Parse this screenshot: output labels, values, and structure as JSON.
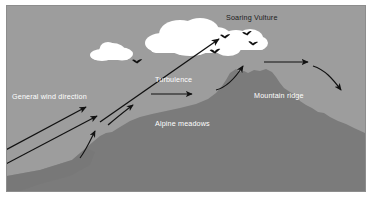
{
  "figure": {
    "frame": {
      "border_color": "#8d8d8d",
      "background_color": "#9d9d9d"
    },
    "colors": {
      "sky": "#9d9d9d",
      "mountain": "#7b7b7b",
      "mountain_shadow": "#6f6f6f",
      "cloud": "#ffffff",
      "arrow": "#111111",
      "label_light": "#ffffff",
      "label_dark": "#1b1b1b",
      "page": "#ffffff"
    },
    "labels": [
      {
        "id": "general-wind-direction",
        "text": "General wind direction",
        "x": 12,
        "y": 99,
        "tone": "light"
      },
      {
        "id": "turbulence",
        "text": "Turbulence",
        "x": 155,
        "y": 82,
        "tone": "light"
      },
      {
        "id": "soaring-vulture",
        "text": "Soaring Vulture",
        "x": 226,
        "y": 20,
        "tone": "dark"
      },
      {
        "id": "alpine-meadows",
        "text": "Alpine meadows",
        "x": 155,
        "y": 126,
        "tone": "light"
      },
      {
        "id": "mountain-ridge",
        "text": "Mountain ridge",
        "x": 254,
        "y": 98,
        "tone": "light"
      }
    ],
    "arrows": [
      {
        "id": "wind-arrow-lower",
        "kind": "straight",
        "description": "long straight wind arrow from lower left to slope",
        "from": [
          2,
          165
        ],
        "to": [
          101,
          113
        ]
      },
      {
        "id": "wind-arrow-upper",
        "kind": "straight",
        "description": "long straight wind arrow from left edge toward slope break",
        "from": [
          2,
          152
        ],
        "to": [
          90,
          105
        ]
      },
      {
        "id": "slope-updraft-arrow",
        "kind": "curved",
        "description": "short curved updraft arrow rising along lower slope",
        "from": [
          83,
          155
        ],
        "to": [
          96,
          128
        ]
      },
      {
        "id": "turbulence-updraft-arrow",
        "kind": "curved",
        "description": "curved turbulence arrow over mid slope",
        "from": [
          110,
          123
        ],
        "to": [
          137,
          101
        ]
      },
      {
        "id": "turbulence-horizontal-arrow",
        "kind": "straight",
        "description": "horizontal turbulence flow arrow",
        "from": [
          152,
          94
        ],
        "to": [
          196,
          94
        ]
      },
      {
        "id": "soaring-climb-arrow",
        "kind": "straight",
        "description": "long diagonal climb arrow toward the soaring vulture",
        "from": [
          100,
          121
        ],
        "to": [
          222,
          37
        ]
      },
      {
        "id": "ridge-lift-arrow",
        "kind": "curved",
        "description": "curved ridge lift arrow rising to the summit",
        "from": [
          219,
          88
        ],
        "to": [
          247,
          62
        ]
      },
      {
        "id": "crest-flow-arrow",
        "kind": "straight",
        "description": "horizontal arrow over the ridge crest",
        "from": [
          266,
          62
        ],
        "to": [
          312,
          62
        ]
      },
      {
        "id": "lee-downdraft-arrow",
        "kind": "curved",
        "description": "curved descending arrow on the lee side",
        "from": [
          315,
          65
        ],
        "to": [
          345,
          95
        ]
      }
    ],
    "clouds": [
      {
        "id": "cloud-small-left",
        "cx": 112,
        "cy": 51,
        "scale": 0.58
      },
      {
        "id": "cloud-large-center",
        "cx": 185,
        "cy": 38,
        "scale": 1.0
      },
      {
        "id": "cloud-right-lobe",
        "cx": 243,
        "cy": 42,
        "scale": 0.72
      }
    ],
    "birds": [
      {
        "id": "bird-1",
        "x": 137,
        "y": 62,
        "scale": 1.0
      },
      {
        "id": "bird-2",
        "x": 225,
        "y": 37,
        "scale": 1.0
      },
      {
        "id": "bird-3",
        "x": 247,
        "y": 34,
        "scale": 0.95
      },
      {
        "id": "bird-4",
        "x": 253,
        "y": 44,
        "scale": 0.95
      },
      {
        "id": "bird-5",
        "x": 215,
        "y": 52,
        "scale": 1.05
      }
    ]
  }
}
